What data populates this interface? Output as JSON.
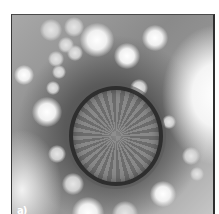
{
  "figure": {
    "panel_label": "a)"
  },
  "colors": {
    "background": "#ffffff",
    "frame_border": "#2e2e2e",
    "particle_ring": "#2c2c2c",
    "stain_dark": "#4a4a4a",
    "stain_light": "#f4f4f4"
  }
}
